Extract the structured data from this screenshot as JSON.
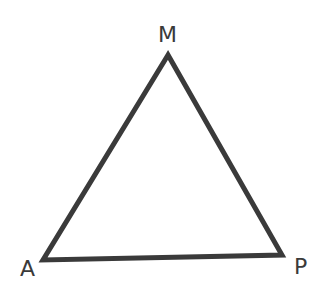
{
  "diagram": {
    "type": "triangle",
    "vertices": [
      {
        "label": "M",
        "x": 168,
        "y": 55
      },
      {
        "label": "A",
        "x": 43,
        "y": 260
      },
      {
        "label": "P",
        "x": 282,
        "y": 255
      }
    ],
    "label_positions": {
      "M": {
        "x": 158,
        "y": 42
      },
      "A": {
        "x": 20,
        "y": 276
      },
      "P": {
        "x": 294,
        "y": 274
      }
    },
    "stroke_color": "#3a3a3a",
    "stroke_width": 5
  }
}
